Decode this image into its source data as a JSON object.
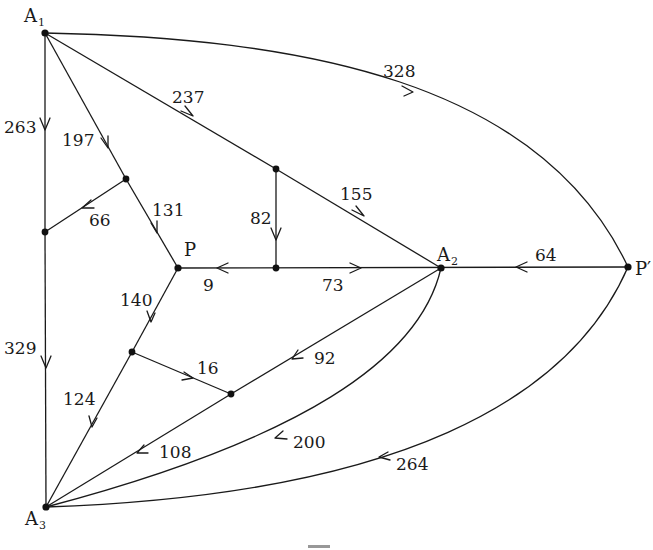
{
  "diagram": {
    "type": "directed weighted graph (network flow)",
    "nodes": [
      {
        "id": "A1",
        "label": "A",
        "sub": "1",
        "x": 45,
        "y": 33,
        "lx": 24,
        "ly": 22
      },
      {
        "id": "A2",
        "label": "A",
        "sub": "2",
        "x": 441,
        "y": 268,
        "lx": 437,
        "ly": 260
      },
      {
        "id": "A3",
        "label": "A",
        "sub": "3",
        "x": 46,
        "y": 507,
        "lx": 26,
        "ly": 525
      },
      {
        "id": "P",
        "label": "P",
        "sub": "",
        "x": 178,
        "y": 268,
        "lx": 184,
        "ly": 255
      },
      {
        "id": "Pp",
        "label": "P′",
        "sub": "",
        "x": 628,
        "y": 267,
        "lx": 635,
        "ly": 275
      },
      {
        "id": "N1",
        "label": "",
        "sub": "",
        "x": 126,
        "y": 179
      },
      {
        "id": "N2",
        "label": "",
        "sub": "",
        "x": 45,
        "y": 232
      },
      {
        "id": "N3",
        "label": "",
        "sub": "",
        "x": 276,
        "y": 169
      },
      {
        "id": "N4",
        "label": "",
        "sub": "",
        "x": 276,
        "y": 268
      },
      {
        "id": "N5",
        "label": "",
        "sub": "",
        "x": 132,
        "y": 352
      },
      {
        "id": "N6",
        "label": "",
        "sub": "",
        "x": 231,
        "y": 394
      }
    ],
    "edges": [
      {
        "from": "A1",
        "to": "N2",
        "weight": "263",
        "lx": 4,
        "ly": 133
      },
      {
        "from": "N2",
        "to": "A3",
        "weight": "329",
        "lx": 4,
        "ly": 354
      },
      {
        "from": "A1",
        "to": "N1",
        "weight": "197",
        "lx": 62,
        "ly": 146
      },
      {
        "from": "N1",
        "to": "N2",
        "weight": "66",
        "lx": 89,
        "ly": 226
      },
      {
        "from": "N1",
        "to": "P",
        "weight": "131",
        "lx": 152,
        "ly": 216
      },
      {
        "from": "A1",
        "to": "N3",
        "weight": "237",
        "lx": 172,
        "ly": 103
      },
      {
        "from": "N3",
        "to": "A2",
        "weight": "155",
        "lx": 340,
        "ly": 200
      },
      {
        "from": "N3",
        "to": "N4",
        "weight": "82",
        "lx": 250,
        "ly": 223
      },
      {
        "from": "N4",
        "to": "P",
        "weight": "9",
        "lx": 203,
        "ly": 290
      },
      {
        "from": "N4",
        "to": "A2",
        "weight": "73",
        "lx": 322,
        "ly": 290
      },
      {
        "from": "Pp",
        "to": "A2",
        "weight": "64",
        "lx": 535,
        "ly": 261
      },
      {
        "from": "A1",
        "to": "Pp",
        "weight": "328",
        "lx": 383,
        "ly": 77
      },
      {
        "from": "P",
        "to": "N5",
        "weight": "140",
        "lx": 120,
        "ly": 305
      },
      {
        "from": "N5",
        "to": "N6",
        "weight": "16",
        "lx": 197,
        "ly": 374
      },
      {
        "from": "N5",
        "to": "A3",
        "weight": "124",
        "lx": 63,
        "ly": 405
      },
      {
        "from": "A2",
        "to": "N6",
        "weight": "92",
        "lx": 314,
        "ly": 364
      },
      {
        "from": "N6",
        "to": "A3",
        "weight": "108",
        "lx": 159,
        "ly": 458
      },
      {
        "from": "A2",
        "to": "A3",
        "weight": "200",
        "lx": 293,
        "ly": 448
      },
      {
        "from": "Pp",
        "to": "A3",
        "weight": "264",
        "lx": 396,
        "ly": 470
      }
    ]
  }
}
